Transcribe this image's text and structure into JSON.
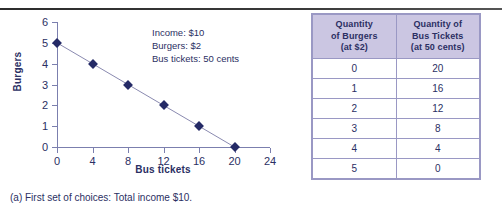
{
  "figure": {
    "caption": "(a) First set of choices: Total income $10.",
    "annotation_lines": [
      "Income: $10",
      "Burgers: $2",
      "Bus tickets: 50 cents"
    ]
  },
  "colors": {
    "axis": "#7b7fae",
    "marker": "#242a66",
    "line": "#8a8ab0",
    "text": "#2b2f63",
    "table_header_bg": "#cbc6e2",
    "table_border": "#9a98c4"
  },
  "chart_data": {
    "type": "line",
    "title": "",
    "xlabel": "Bus tickets",
    "ylabel": "Burgers",
    "xlim": [
      0,
      24
    ],
    "ylim": [
      0,
      6
    ],
    "xticks": [
      0,
      4,
      8,
      12,
      16,
      20,
      24
    ],
    "yticks": [
      0,
      1,
      2,
      3,
      4,
      5,
      6
    ],
    "grid": false,
    "legend": "none",
    "series": [
      {
        "name": "Budget constraint",
        "x": [
          0,
          4,
          8,
          12,
          16,
          20
        ],
        "y": [
          5,
          4,
          3,
          2,
          1,
          0
        ],
        "marker": "diamond"
      }
    ],
    "annotations": [
      "Income: $10",
      "Burgers: $2",
      "Bus tickets: 50 cents"
    ]
  },
  "table": {
    "headers": [
      "Quantity\nof Burgers\n(at $2)",
      "Quantity of\nBus Tickets\n(at 50 cents)"
    ],
    "header_col1_lines": [
      "Quantity",
      "of Burgers",
      "(at $2)"
    ],
    "header_col2_lines": [
      "Quantity of",
      "Bus Tickets",
      "(at 50 cents)"
    ],
    "rows": [
      [
        "0",
        "20"
      ],
      [
        "1",
        "16"
      ],
      [
        "2",
        "12"
      ],
      [
        "3",
        "8"
      ],
      [
        "4",
        "4"
      ],
      [
        "5",
        "0"
      ]
    ]
  }
}
